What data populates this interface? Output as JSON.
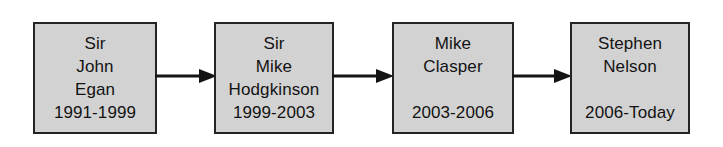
{
  "diagram": {
    "type": "flow-sequence",
    "background_color": "#ffffff",
    "node_fill_color": "#d2d2d2",
    "node_border_color": "#242424",
    "text_color": "#121212",
    "nodes": [
      {
        "id": "node-1",
        "name_lines": [
          "Sir",
          "John",
          "Egan"
        ],
        "line1": "Sir",
        "line2": "John",
        "line3": "Egan",
        "term": "1991-1999"
      },
      {
        "id": "node-2",
        "name_lines": [
          "Sir",
          "Mike",
          "Hodgkinson"
        ],
        "line1": "Sir",
        "line2": "Mike",
        "line3": "Hodgkinson",
        "term": "1999-2003"
      },
      {
        "id": "node-3",
        "name_lines": [
          "Mike",
          "Clasper"
        ],
        "line1": "Mike",
        "line2": "Clasper",
        "term": "2003-2006"
      },
      {
        "id": "node-4",
        "name_lines": [
          "Stephen",
          "Nelson"
        ],
        "line1": "Stephen",
        "line2": "Nelson",
        "term": "2006-Today"
      }
    ],
    "connectors": [
      {
        "id": "connector-1",
        "icon": "arrow-right-icon",
        "from": "node-1",
        "to": "node-2"
      },
      {
        "id": "connector-2",
        "icon": "arrow-right-icon",
        "from": "node-2",
        "to": "node-3"
      },
      {
        "id": "connector-3",
        "icon": "arrow-right-icon",
        "from": "node-3",
        "to": "node-4"
      }
    ]
  }
}
